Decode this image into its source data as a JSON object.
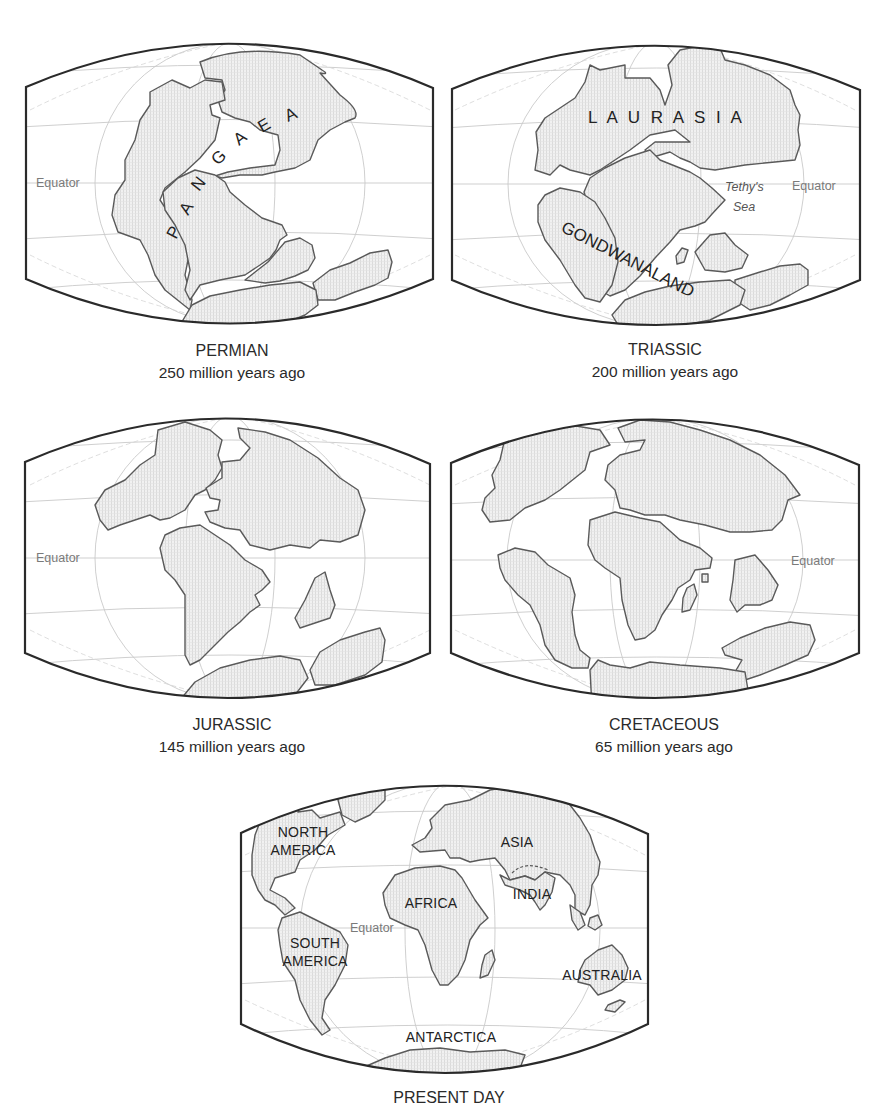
{
  "figure": {
    "colors": {
      "frame": "#2a2a2a",
      "coastline": "#5a5a5a",
      "land_fill": "#ececec",
      "graticule": "#c9c9c9",
      "equator_label": "#7a7a7a",
      "text": "#2a2a2a"
    }
  },
  "panels": [
    {
      "id": "permian",
      "period": "PERMIAN",
      "age": "250 million years ago",
      "equator_label": "Equator",
      "labels": {
        "supercontinent": [
          "P",
          "A",
          "N",
          "G",
          "A",
          "E",
          "A"
        ]
      }
    },
    {
      "id": "triassic",
      "period": "TRIASSIC",
      "age": "200 million years ago",
      "equator_label": "Equator",
      "labels": {
        "north": "L A U R A S I A",
        "south": "GONDWANALAND",
        "sea_line1": "Tethy's",
        "sea_line2": "Sea"
      }
    },
    {
      "id": "jurassic",
      "period": "JURASSIC",
      "age": "145 million years ago",
      "equator_label": "Equator"
    },
    {
      "id": "cretaceous",
      "period": "CRETACEOUS",
      "age": "65 million years ago",
      "equator_label": "Equator"
    },
    {
      "id": "present",
      "period": "PRESENT DAY",
      "equator_label": "Equator",
      "labels": {
        "north_america_1": "NORTH",
        "north_america_2": "AMERICA",
        "south_america_1": "SOUTH",
        "south_america_2": "AMERICA",
        "africa": "AFRICA",
        "asia": "ASIA",
        "india": "INDIA",
        "australia": "AUSTRALIA",
        "antarctica": "ANTARCTICA"
      }
    }
  ]
}
